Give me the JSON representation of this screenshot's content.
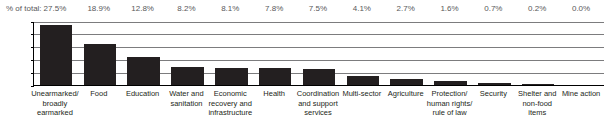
{
  "header": {
    "percent_caption": "% of total:"
  },
  "chart_data": {
    "type": "bar",
    "title": "",
    "subtitle": "",
    "xlabel": "",
    "ylabel": "",
    "ylim": [
      0,
      25
    ],
    "yticks": [
      0,
      5,
      10,
      15,
      20,
      25
    ],
    "ytick_labels": [
      "0",
      "5",
      "10",
      "15",
      "20",
      "25"
    ],
    "grid": true,
    "legend": false,
    "bar_color": "#231f20",
    "gridline_color": "#7c7c7e",
    "categories": [
      "Unearmarked/ broadly earmarked",
      "Food",
      "Education",
      "Water and sanitation",
      "Economic recovery and infrastructure",
      "Health",
      "Coordination and support services",
      "Multi-sector",
      "Agriculture",
      "Protection/ human rights/ rule of law",
      "Security",
      "Shelter and non-food items",
      "Mine action"
    ],
    "category_lines": [
      [
        "Unearmarked/",
        "broadly",
        "earmarked"
      ],
      [
        "Food"
      ],
      [
        "Education"
      ],
      [
        "Water and",
        "sanitation"
      ],
      [
        "Economic",
        "recovery and",
        "infrastructure"
      ],
      [
        "Health"
      ],
      [
        "Coordination",
        "and support",
        "services"
      ],
      [
        "Multi-sector"
      ],
      [
        "Agriculture"
      ],
      [
        "Protection/",
        "human rights/",
        "rule of law"
      ],
      [
        "Security"
      ],
      [
        "Shelter and",
        "non-food",
        "items"
      ],
      [
        "Mine action"
      ]
    ],
    "values": [
      23.3,
      16.0,
      10.8,
      6.9,
      6.8,
      6.6,
      6.3,
      3.5,
      2.3,
      1.4,
      0.6,
      0.2,
      0.0
    ],
    "percent_labels": [
      "27.5%",
      "18.9%",
      "12.8%",
      "8.2%",
      "8.1%",
      "7.8%",
      "7.5%",
      "4.1%",
      "2.7%",
      "1.6%",
      "0.7%",
      "0.2%",
      "0.0%"
    ],
    "percents": [
      27.5,
      18.9,
      12.8,
      8.2,
      8.1,
      7.8,
      7.5,
      4.1,
      2.7,
      1.6,
      0.7,
      0.2,
      0.0
    ]
  }
}
